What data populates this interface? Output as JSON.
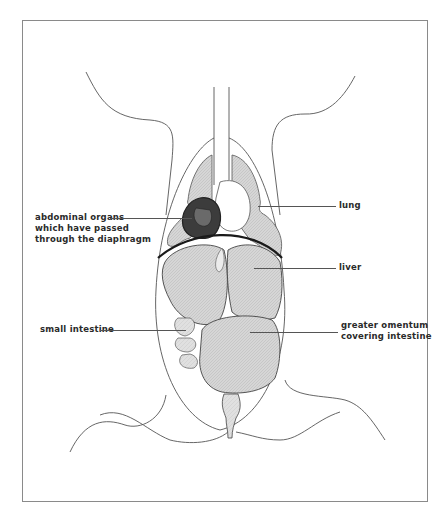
{
  "figure": {
    "type": "anatomical-diagram"
  },
  "labels": {
    "abdominal_organs": {
      "line1": "abdominal organs",
      "line2": "which have passed",
      "line3": "through the diaphragm"
    },
    "lung": "lung",
    "liver": "liver",
    "small_intestine": "small intestine",
    "greater_omentum": {
      "line1": "greater omentum",
      "line2": "covering intestine"
    }
  },
  "colors": {
    "outline": "#3a3a3a",
    "organ_fill": "#d4d4d4",
    "organ_fill_light": "#e2e2e2",
    "herniated_fill": "#3c3c3c",
    "frame": "#8a8a8a",
    "background": "#ffffff"
  }
}
